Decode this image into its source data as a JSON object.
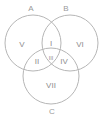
{
  "diagram": {
    "background_color": "#ffffff",
    "stroke_color": "#b6b6b6",
    "label_color": "#8e8e8e",
    "set_label_color": "#9a9a9a",
    "sets": [
      {
        "id": "A",
        "label": "A",
        "cx": 33,
        "cy": 43,
        "r": 28,
        "label_x": 31,
        "label_y": 9
      },
      {
        "id": "B",
        "label": "B",
        "cx": 70,
        "cy": 43,
        "r": 28,
        "label_x": 66,
        "label_y": 9
      },
      {
        "id": "C",
        "label": "C",
        "cx": 51,
        "cy": 76,
        "r": 28,
        "label_x": 52,
        "label_y": 112
      }
    ],
    "regions": [
      {
        "id": "I",
        "label": "I",
        "meaning": "A and B only",
        "x": 51,
        "y": 44
      },
      {
        "id": "II",
        "label": "II",
        "meaning": "A and C only",
        "x": 37,
        "y": 62
      },
      {
        "id": "III",
        "label": "III",
        "meaning": "A and B and C",
        "x": 51,
        "y": 59
      },
      {
        "id": "IV",
        "label": "IV",
        "meaning": "B and C only",
        "x": 64,
        "y": 62
      },
      {
        "id": "V",
        "label": "V",
        "meaning": "A only",
        "x": 22,
        "y": 45
      },
      {
        "id": "VI",
        "label": "VI",
        "meaning": "B only",
        "x": 80,
        "y": 45
      },
      {
        "id": "VII",
        "label": "VII",
        "meaning": "C only",
        "x": 51,
        "y": 86
      }
    ]
  }
}
